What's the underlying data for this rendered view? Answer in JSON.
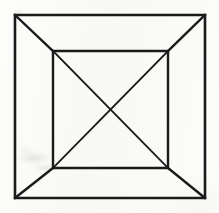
{
  "figure": {
    "medium": "ink line drawing on paper",
    "background_color": "#fbfbf9",
    "ink_color": "#1a1a1a",
    "canvas": {
      "width": 219,
      "height": 213
    },
    "stroke_widths": {
      "outer_square": 2.6,
      "inner_square": 2.4,
      "corner_diagonal": 2.4,
      "inner_cross": 1.8
    },
    "shapes": [
      {
        "id": "outer-square",
        "name": "outer-square",
        "type": "polygon",
        "points": "15,15 205,15 205,198 15,198",
        "stroke_width": 2.6
      },
      {
        "id": "inner-square",
        "name": "inner-square",
        "type": "polygon",
        "points": "53,51 168,51 168,168 53,168",
        "stroke_width": 2.4
      }
    ],
    "corner_diagonals": [
      {
        "id": "diagonal-top-left",
        "name": "corner-diagonal-top-left",
        "x1": 15,
        "y1": 15,
        "x2": 53,
        "y2": 51
      },
      {
        "id": "diagonal-top-right",
        "name": "corner-diagonal-top-right",
        "x1": 205,
        "y1": 15,
        "x2": 168,
        "y2": 51
      },
      {
        "id": "diagonal-bottom-right",
        "name": "corner-diagonal-bottom-right",
        "x1": 205,
        "y1": 198,
        "x2": 168,
        "y2": 168
      },
      {
        "id": "diagonal-bottom-left",
        "name": "corner-diagonal-bottom-left",
        "x1": 15,
        "y1": 198,
        "x2": 53,
        "y2": 168
      }
    ],
    "inner_cross": [
      {
        "id": "cross-nw-se",
        "name": "inner-diagonal-nw-se",
        "x1": 53,
        "y1": 51,
        "x2": 168,
        "y2": 168
      },
      {
        "id": "cross-ne-sw",
        "name": "inner-diagonal-ne-sw",
        "x1": 168,
        "y1": 51,
        "x2": 53,
        "y2": 168
      }
    ],
    "center_point": {
      "x": 110,
      "y": 110
    }
  }
}
